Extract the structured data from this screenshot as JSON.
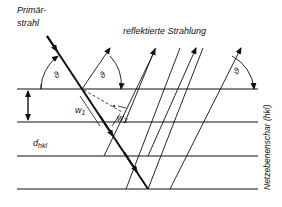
{
  "diagram": {
    "labels": {
      "primary_beam_line1": "Primär-",
      "primary_beam_line2": "strahl",
      "reflected_radiation": "reflektierte Strahlung",
      "lattice_planes": "Netzebenenschar (hkl)",
      "theta": "ϑ",
      "w1_base": "w",
      "w1_sub": "1",
      "w2_base": "w",
      "w2_sub": "2",
      "d_base": "d",
      "d_sub": "hkl"
    },
    "planes_y": [
      89,
      122,
      156,
      189
    ],
    "colors": {
      "line": "#111111",
      "background": "#ffffff"
    }
  }
}
